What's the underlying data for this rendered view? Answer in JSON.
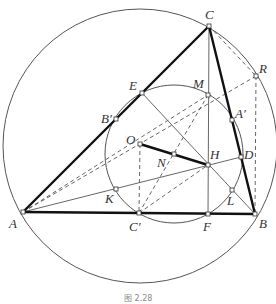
{
  "figure": {
    "caption": "图 2.28",
    "type": "geometry-diagram"
  },
  "points": {
    "A": {
      "label": "A",
      "x": 23,
      "y": 212
    },
    "B": {
      "label": "B",
      "x": 255,
      "y": 214
    },
    "C": {
      "label": "C",
      "x": 209,
      "y": 26
    },
    "O": {
      "label": "O",
      "x": 140,
      "y": 144
    },
    "H": {
      "label": "H",
      "x": 208,
      "y": 165
    },
    "N": {
      "label": "N",
      "x": 174,
      "y": 154
    },
    "M": {
      "label": "M",
      "x": 208,
      "y": 95
    },
    "E": {
      "label": "E",
      "x": 142,
      "y": 93
    },
    "Bp": {
      "label": "B′",
      "x": 116,
      "y": 119
    },
    "Ap": {
      "label": "A′",
      "x": 232,
      "y": 120
    },
    "D": {
      "label": "D",
      "x": 241,
      "y": 157
    },
    "K": {
      "label": "K",
      "x": 116,
      "y": 189
    },
    "L": {
      "label": "L",
      "x": 232,
      "y": 190
    },
    "Cp": {
      "label": "C′",
      "x": 139,
      "y": 213
    },
    "F": {
      "label": "F",
      "x": 208,
      "y": 214
    },
    "R": {
      "label": "R",
      "x": 256,
      "y": 76
    }
  },
  "circles": {
    "circumcircle": {
      "cx": 140,
      "cy": 146,
      "r": 137
    },
    "nine_point_circle": {
      "cx": 174,
      "cy": 154,
      "r": 69
    }
  }
}
